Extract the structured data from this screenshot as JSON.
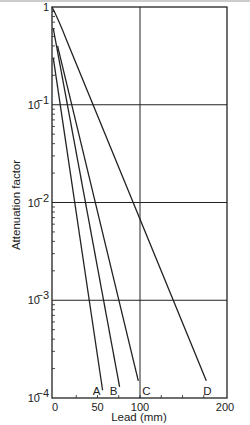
{
  "chart_data": {
    "type": "line",
    "title": "",
    "xlabel": "Lead (mm)",
    "ylabel": "Attenuation factor",
    "xscale": "linear",
    "yscale": "log",
    "xlim": [
      -4,
      200
    ],
    "ylim": [
      0.0001,
      1
    ],
    "x_ticks": [
      0,
      50,
      100,
      200
    ],
    "x_tick_labels": [
      "0",
      "50",
      "100",
      "200"
    ],
    "y_ticks": [
      1,
      0.1,
      0.01,
      0.001,
      0.0001
    ],
    "y_tick_labels": [
      "1",
      "10",
      "10",
      "10",
      "10"
    ],
    "y_tick_exponents": [
      "",
      "−1",
      "−2",
      "−3",
      "−4"
    ],
    "grid": {
      "vertical_at_x": [
        100
      ],
      "horizontal_at_y": [
        0.1,
        0.01,
        0.001
      ]
    },
    "series": [
      {
        "name": "A",
        "x": [
          -2,
          56
        ],
        "y": [
          0.3,
          0.00012
        ]
      },
      {
        "name": "B",
        "x": [
          -2,
          76
        ],
        "y": [
          0.6,
          0.00013
        ]
      },
      {
        "name": "C",
        "x": [
          3,
          98
        ],
        "y": [
          0.4,
          0.00015
        ]
      },
      {
        "name": "D",
        "x": [
          -4,
          10,
          178
        ],
        "y": [
          1,
          0.55,
          0.00015
        ]
      }
    ]
  },
  "labels": {
    "xlabel": "Lead (mm)",
    "ylabel": "Attenuation factor",
    "curves": [
      "A",
      "B",
      "C",
      "D"
    ]
  }
}
